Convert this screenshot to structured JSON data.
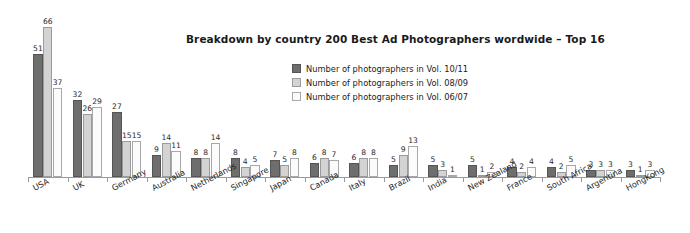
{
  "chart_data": {
    "type": "bar",
    "title": "Breakdown by country 200 Best Ad Photographers wordwide – Top 16",
    "xlabel": "",
    "ylabel": "",
    "ylim": [
      0,
      66
    ],
    "grid": false,
    "legend_position": "top-center",
    "categories": [
      "USA",
      "UK",
      "Germany",
      "Australia",
      "Netherlands",
      "Singapore",
      "Japan",
      "Canada",
      "Italy",
      "Brazil",
      "India",
      "New Zealand",
      "France",
      "South Africa",
      "Argentina",
      "HongKong"
    ],
    "series": [
      {
        "name": "Number of photographers in Vol. 10/11",
        "color": "#6e6e6e",
        "values": [
          51,
          32,
          27,
          9,
          8,
          8,
          7,
          6,
          6,
          5,
          5,
          5,
          4,
          4,
          3,
          3
        ]
      },
      {
        "name": "Number of photographers in Vol. 08/09",
        "color": "#d3d3d3",
        "values": [
          66,
          26,
          15,
          14,
          8,
          4,
          5,
          8,
          8,
          9,
          3,
          1,
          2,
          2,
          3,
          1
        ]
      },
      {
        "name": "Number of photographers in Vol. 06/07",
        "color": "#fbfbfb",
        "values": [
          37,
          29,
          15,
          11,
          14,
          5,
          8,
          7,
          8,
          13,
          1,
          2,
          4,
          5,
          3,
          3
        ]
      }
    ]
  },
  "colors": {
    "series_1": "#6e6e6e",
    "series_2": "#d3d3d3",
    "series_3": "#fbfbfb",
    "axis": "#9a9a9a",
    "text": "#1f1f1f",
    "background": "#ffffff"
  }
}
